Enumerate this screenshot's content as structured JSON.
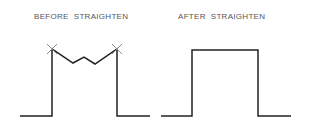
{
  "panels": [
    {
      "label": "BEFORE  STRAIGHTEN",
      "description": "Wall outline with zigzag top segment and X vertex markers"
    },
    {
      "label": "AFTER  STRAIGHTEN",
      "description": "Wall outline with straight top segment"
    }
  ],
  "colors": {
    "line": "#222222",
    "marker": "#888888",
    "text": "#555555"
  }
}
